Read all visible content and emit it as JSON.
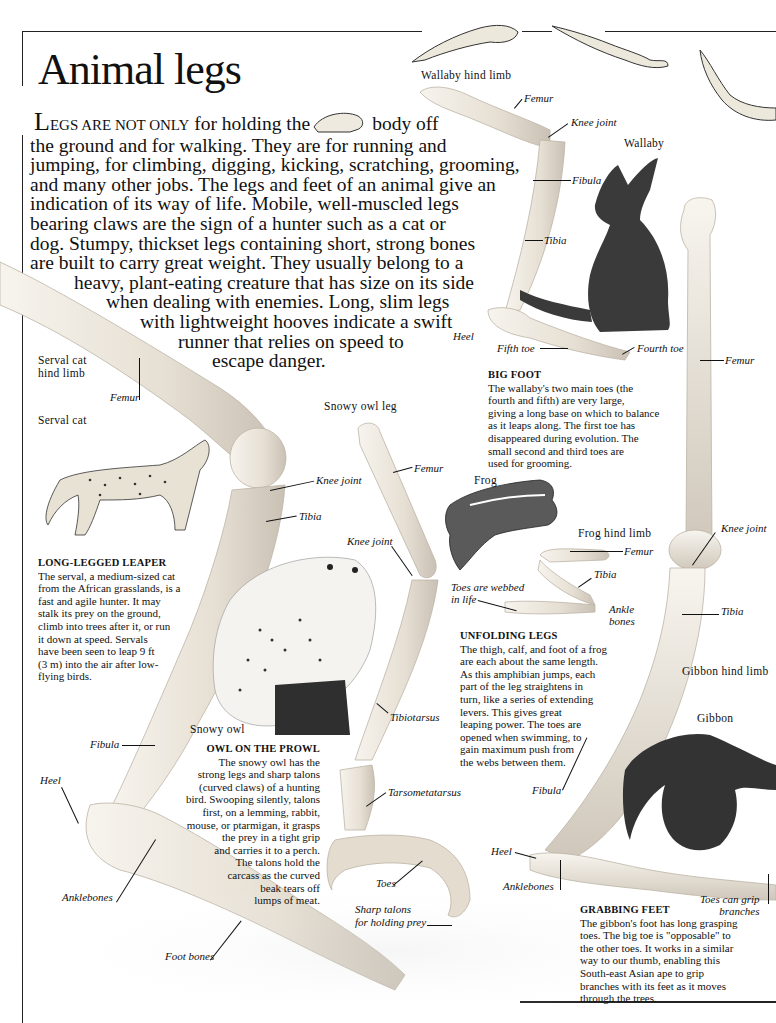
{
  "page": {
    "title": "Animal legs",
    "intro": {
      "dropcap": "L",
      "smallcaps": "EGS ARE NOT ONLY",
      "lines": [
        " for holding the",
        "body off",
        "the ground and for walking. They are for running and",
        "jumping, for climbing, digging, kicking, scratching, grooming,",
        "and many other jobs. The legs and feet of an animal give an",
        "indication of its way of life. Mobile, well-muscled legs",
        "bearing claws are the sign of a hunter such as a cat or",
        "dog. Stumpy, thickset legs containing short, strong bones",
        "are built to carry great weight. They usually belong to a",
        "heavy, plant-eating creature that has size on its side",
        "when dealing with enemies. Long, slim legs",
        "with lightweight hooves indicate a swift",
        "runner that relies on speed to",
        "escape danger."
      ]
    }
  },
  "wallaby": {
    "limb_title": "Wallaby hind limb",
    "animal_name": "Wallaby",
    "labels": {
      "femur": "Femur",
      "knee_joint": "Knee joint",
      "fibula": "Fibula",
      "tibia": "Tibia",
      "heel": "Heel",
      "fifth_toe": "Fifth toe",
      "fourth_toe": "Fourth toe"
    },
    "caption": {
      "heading": "BIG FOOT",
      "lines": [
        "The wallaby's two main toes (the",
        "fourth and fifth) are very large,",
        "giving a long base on which to balance",
        "as it leaps along. The first toe has",
        "disappeared during evolution. The",
        "small second and third toes are",
        "used for grooming."
      ]
    }
  },
  "serval": {
    "limb_title_lines": [
      "Serval cat",
      "hind limb"
    ],
    "animal_name": "Serval cat",
    "labels": {
      "femur": "Femur",
      "knee_joint": "Knee joint",
      "tibia": "Tibia",
      "fibula": "Fibula",
      "heel": "Heel",
      "anklebones": "Anklebones",
      "foot_bones": "Foot bones"
    },
    "caption": {
      "heading": "LONG-LEGGED LEAPER",
      "lines": [
        "The serval, a medium-sized cat",
        "from the African grasslands, is a",
        "fast and agile hunter. It may",
        "stalk its prey on the ground,",
        "climb into trees after it, or run",
        "it down at speed. Servals",
        "have been seen to leap 9 ft",
        "(3 m) into the air after low-",
        "flying birds."
      ]
    }
  },
  "owl": {
    "limb_title": "Snowy owl leg",
    "animal_name": "Snowy owl",
    "labels": {
      "femur": "Femur",
      "knee_joint": "Knee joint",
      "tibiotarsus": "Tibiotarsus",
      "tarsometatarsus": "Tarsometatarsus",
      "toes": "Toes",
      "talons_lines": [
        "Sharp talons",
        "for holding prey"
      ]
    },
    "caption": {
      "heading": "OWL ON THE PROWL",
      "lines": [
        "The snowy owl has the",
        "strong legs and sharp talons",
        "(curved claws) of a hunting",
        "bird. Swooping silently, talons",
        "first, on a lemming, rabbit,",
        "mouse, or ptarmigan, it grasps",
        "the prey in a tight grip",
        "and carries it to a perch.",
        "The talons hold the",
        "carcass as the curved",
        "beak tears off",
        "lumps of meat."
      ]
    }
  },
  "frog": {
    "animal_name": "Frog",
    "limb_title": "Frog hind limb",
    "labels": {
      "femur": "Femur",
      "tibia": "Tibia",
      "ankle_bones_lines": [
        "Ankle",
        "bones"
      ],
      "webbed_lines": [
        "Toes are webbed",
        "in life"
      ]
    },
    "caption": {
      "heading": "UNFOLDING LEGS",
      "lines": [
        "The thigh, calf, and foot of a frog",
        "are each about the same length.",
        "As this amphibian jumps, each",
        "part of the leg straightens in",
        "turn, like a series of extending",
        "levers. This gives great",
        "leaping power. The toes are",
        "opened when swimming, to",
        "gain maximum push from",
        "the webs between them."
      ]
    }
  },
  "gibbon": {
    "limb_title": "Gibbon hind limb",
    "animal_name": "Gibbon",
    "labels": {
      "femur": "Femur",
      "knee_joint": "Knee joint",
      "tibia": "Tibia",
      "fibula": "Fibula",
      "heel": "Heel",
      "anklebones": "Anklebones",
      "toes_lines": [
        "Toes can grip",
        "branches"
      ]
    },
    "caption": {
      "heading": "GRABBING FEET",
      "lines": [
        "The gibbon's foot has long grasping",
        "toes. The big toe is \"opposable\" to",
        "the other toes. It works in a similar",
        "way to our thumb, enabling this",
        "South-east Asian ape to grip",
        "branches with its feet as it moves",
        "through the trees."
      ]
    }
  },
  "colors": {
    "bone": "#ece6dc",
    "bone_shadow": "#c9c1b4",
    "ink": "#111111",
    "frog_skin": "#e8e4d8"
  }
}
